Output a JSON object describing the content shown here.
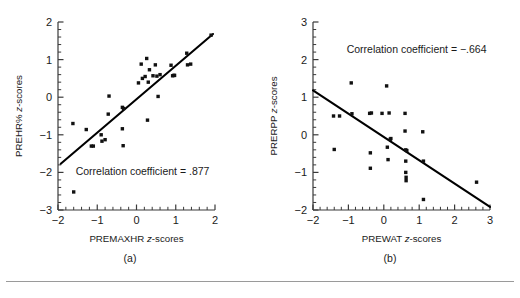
{
  "figure": {
    "rule_visible": true,
    "marker_color": "#111111",
    "axis_color": "#3a3a3a",
    "line_color": "#000000"
  },
  "chart_data": [
    {
      "type": "scatter",
      "panel_label": "(a)",
      "title": "",
      "xlabel_prefix": "PREMAXHR ",
      "xlabel_italic": "z",
      "xlabel_suffix": "-scores",
      "xlabel": "PREMAXHR z-scores",
      "ylabel_prefix": "PREHR% ",
      "ylabel_italic": "z",
      "ylabel_suffix": "-scores",
      "ylabel": "PREHR% z-scores",
      "xlim": [
        -2,
        2
      ],
      "ylim": [
        -3,
        2
      ],
      "xticks": [
        -2,
        -1,
        0,
        1,
        2
      ],
      "yticks": [
        -3,
        -2,
        -1,
        0,
        1,
        2
      ],
      "xticklabels": [
        "-2",
        "-1",
        "0",
        "1",
        "2"
      ],
      "yticklabels": [
        "-3",
        "-2",
        "-1",
        "0",
        "1",
        "2"
      ],
      "minor_ticks_per_interval": 5,
      "grid": false,
      "annotation": "Correlation coefficient = .877",
      "annotation_x": -1.55,
      "annotation_y": -2.07,
      "correlation_coefficient": 0.877,
      "fit_line": {
        "x0": -1.93,
        "y0": -1.77,
        "x1": 1.95,
        "y1": 1.68
      },
      "x": [
        -1.62,
        -1.6,
        -1.28,
        -1.15,
        -1.1,
        -0.9,
        -0.88,
        -0.8,
        -0.72,
        -0.7,
        -0.36,
        -0.36,
        -0.34,
        -0.33,
        0.05,
        0.12,
        0.15,
        0.22,
        0.26,
        0.28,
        0.3,
        0.33,
        0.42,
        0.48,
        0.52,
        0.55,
        0.6,
        0.88,
        0.92,
        0.95,
        0.97,
        1.28,
        1.3,
        1.38,
        1.9
      ],
      "y": [
        -0.7,
        -2.52,
        -0.86,
        -1.3,
        -1.3,
        -1.0,
        -1.17,
        -1.13,
        -0.45,
        0.03,
        -0.27,
        -0.84,
        -1.29,
        -0.3,
        0.38,
        0.88,
        0.5,
        0.55,
        1.03,
        -0.61,
        0.4,
        0.73,
        0.57,
        0.86,
        0.56,
        0.02,
        0.6,
        0.85,
        0.57,
        0.58,
        0.58,
        1.17,
        0.86,
        0.88,
        1.65
      ]
    },
    {
      "type": "scatter",
      "panel_label": "(b)",
      "title": "",
      "xlabel_prefix": "PREWAT ",
      "xlabel_italic": "z",
      "xlabel_suffix": "-scores",
      "xlabel": "PREWAT z-scores",
      "ylabel_prefix": "PRERPP ",
      "ylabel_italic": "z",
      "ylabel_suffix": "-scores",
      "ylabel": "PRERPP z-scores",
      "xlim": [
        -2,
        3
      ],
      "ylim": [
        -2,
        3
      ],
      "xticks": [
        -2,
        -1,
        0,
        1,
        2,
        3
      ],
      "yticks": [
        -2,
        -1,
        0,
        1,
        2,
        3
      ],
      "xticklabels": [
        "-2",
        "-1",
        "0",
        "1",
        "2",
        "3"
      ],
      "yticklabels": [
        "-2",
        "-1",
        "0",
        "1",
        "2",
        "3"
      ],
      "minor_ticks_per_interval": 5,
      "grid": false,
      "annotation": "Correlation coefficient = −.664",
      "annotation_x": -1.05,
      "annotation_y": 2.18,
      "correlation_coefficient": -0.664,
      "fit_line": {
        "x0": -2.0,
        "y0": 1.18,
        "x1": 3.0,
        "y1": -1.92
      },
      "x": [
        -1.42,
        -1.4,
        -1.25,
        -0.92,
        -0.9,
        -0.4,
        -0.38,
        -0.38,
        -0.35,
        -0.05,
        0.08,
        0.1,
        0.12,
        0.15,
        0.18,
        0.2,
        0.6,
        0.6,
        0.62,
        0.62,
        0.62,
        0.63,
        0.63,
        0.65,
        1.1,
        1.12,
        1.12,
        2.62
      ],
      "y": [
        0.5,
        -0.39,
        0.5,
        1.38,
        0.56,
        0.57,
        -0.48,
        -0.89,
        0.58,
        0.57,
        1.3,
        -0.33,
        -0.66,
        0.58,
        -0.12,
        -0.1,
        0.57,
        0.1,
        -0.4,
        -0.7,
        -1.0,
        -1.13,
        -1.22,
        -0.42,
        0.08,
        -0.7,
        -1.72,
        -1.26
      ]
    }
  ]
}
